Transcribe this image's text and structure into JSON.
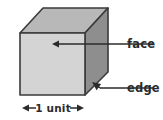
{
  "figure": {
    "background_color": "#ffffff"
  },
  "cube": {
    "front_face": {
      "name": "front-face",
      "fill": "#d4d4d4",
      "stroke": "#3a3a3a",
      "points": "20,33 85,33 85,95 20,95"
    },
    "top_face": {
      "name": "top-face",
      "fill": "#b8b8b8",
      "stroke": "#3a3a3a",
      "points": "20,33 43,8 108,8 85,33"
    },
    "right_face": {
      "name": "right-face",
      "fill": "#8e8e8e",
      "stroke": "#3a3a3a",
      "points": "85,33 108,8 108,72 85,95"
    },
    "stroke_width": 1.6
  },
  "annotations": {
    "face": {
      "label": "face",
      "text_x": 127,
      "text_y": 48,
      "leader_start_x": 153,
      "leader_start_y": 44,
      "leader_end_x": 54,
      "leader_end_y": 44,
      "arrow_tip_x": 52,
      "arrow_tip_y": 44,
      "color": "#2b2b2b"
    },
    "edge": {
      "label": "edge",
      "text_x": 127,
      "text_y": 92,
      "leader_start_x": 153,
      "leader_start_y": 88,
      "leader_end_x": 100,
      "leader_end_y": 88,
      "arrow_tip_x": 92,
      "arrow_tip_y": 82,
      "color": "#2b2b2b"
    },
    "dimension": {
      "label": "1 unit",
      "text_x": 52,
      "text_y": 112,
      "line_y": 108,
      "left_tip_x": 22,
      "right_tip_x": 84,
      "color": "#2b2b2b"
    }
  },
  "colors": {
    "outline": "#3a3a3a",
    "front": "#d4d4d4",
    "top": "#b8b8b8",
    "right": "#8e8e8e",
    "text": "#2b2b2b"
  }
}
